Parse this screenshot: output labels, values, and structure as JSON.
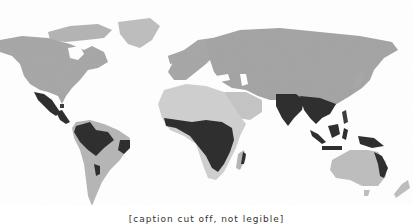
{
  "map": {
    "type": "world-map-grayscale",
    "projection": "equirectangular-like",
    "background": "#ffffff",
    "colors": {
      "land_temperate": "#a6a6a6",
      "land_desert": "#cfcfcf",
      "land_south": "#b5b5b5",
      "highlighted_region": "#2b2b2b",
      "ocean": "#ffffff"
    },
    "highlighted_regions": [
      "Mexico / Central America",
      "Caribbean",
      "Northern South America (Amazon)",
      "Eastern Brazil coast",
      "Central/Southern Brazil patch",
      "Central Africa",
      "Madagascar east coast",
      "India",
      "Southeast Asia",
      "Indonesia / New Guinea",
      "Northeast Australia"
    ]
  },
  "caption": {
    "text": "[caption cut off, not legible]"
  }
}
